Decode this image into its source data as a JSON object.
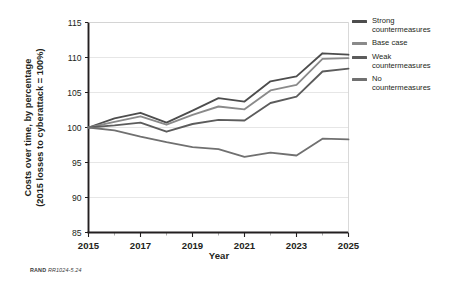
{
  "figure": {
    "footer_mark": "RAND",
    "footer_id": "RR1024-5.24"
  },
  "chart_data": {
    "type": "line",
    "title": "",
    "xlabel": "Year",
    "ylabel": "Costs over time, by percentage (2015 losses to cyberattack = 100%)",
    "ylabel_line1": "Costs over time, by percentage",
    "ylabel_line2": "(2015 losses to cyberattack = 100%)",
    "x": [
      2015,
      2016,
      2017,
      2018,
      2019,
      2020,
      2021,
      2022,
      2023,
      2024,
      2025
    ],
    "categories": [
      "2015",
      "2016",
      "2017",
      "2018",
      "2019",
      "2020",
      "2021",
      "2022",
      "2023",
      "2024",
      "2025"
    ],
    "xtick_labels": [
      "2015",
      "2017",
      "2019",
      "2021",
      "2023",
      "2025"
    ],
    "xtick_values": [
      2015,
      2017,
      2019,
      2021,
      2023,
      2025
    ],
    "ytick_labels": [
      "85",
      "90",
      "95",
      "100",
      "105",
      "110",
      "115"
    ],
    "ytick_values": [
      85,
      90,
      95,
      100,
      105,
      110,
      115
    ],
    "xlim": [
      2015,
      2025
    ],
    "ylim": [
      85,
      115
    ],
    "grid": "horizontal",
    "legend_position": "right",
    "series": [
      {
        "name": "Strong countermeasures",
        "label_line1": "Strong",
        "label_line2": "countermeasures",
        "color": "#4d4d4d",
        "values": [
          100.0,
          101.3,
          102.1,
          100.7,
          102.4,
          104.2,
          103.7,
          106.6,
          107.3,
          110.6,
          110.4
        ]
      },
      {
        "name": "Base case",
        "label_line1": "Base case",
        "label_line2": "",
        "color": "#8a8a8a",
        "values": [
          100.0,
          100.8,
          101.6,
          100.4,
          101.8,
          103.0,
          102.6,
          105.3,
          106.1,
          109.8,
          109.9
        ]
      },
      {
        "name": "Weak countermeasures",
        "label_line1": "Weak",
        "label_line2": "countermeasures",
        "color": "#5c5c5c",
        "values": [
          100.0,
          100.3,
          100.7,
          99.4,
          100.5,
          101.1,
          101.0,
          103.5,
          104.4,
          108.0,
          108.4
        ]
      },
      {
        "name": "No countermeasures",
        "label_line1": "No",
        "label_line2": "countermeasures",
        "color": "#707070",
        "values": [
          100.0,
          99.6,
          98.7,
          97.9,
          97.2,
          96.9,
          95.8,
          96.4,
          96.0,
          98.4,
          98.3
        ]
      }
    ]
  },
  "legend": {
    "items": [
      {
        "line1": "Strong",
        "line2": "countermeasures"
      },
      {
        "line1": "Base case",
        "line2": ""
      },
      {
        "line1": "Weak",
        "line2": "countermeasures"
      },
      {
        "line1": "No",
        "line2": "countermeasures"
      }
    ]
  }
}
